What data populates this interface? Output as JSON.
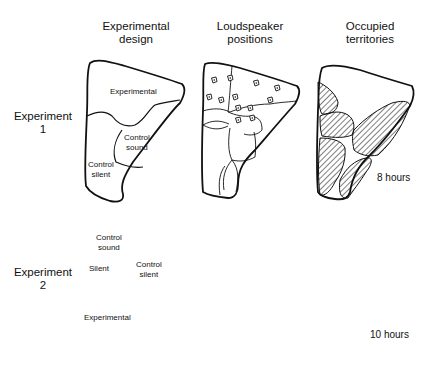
{
  "columns": [
    {
      "line1": "Experimental",
      "line2": "design"
    },
    {
      "line1": "Loudspeaker",
      "line2": "positions"
    },
    {
      "line1": "Occupied",
      "line2": "territories"
    }
  ],
  "rows": [
    {
      "line1": "Experiment",
      "line2": "1"
    },
    {
      "line1": "Experiment",
      "line2": "2"
    }
  ],
  "experiment1": {
    "design_regions": {
      "experimental": "Experimental",
      "control_sound_1": "Control",
      "control_sound_2": "sound",
      "control_silent_1": "Control",
      "control_silent_2": "silent"
    },
    "duration": "8 hours"
  },
  "experiment2": {
    "design_regions": {
      "control_sound_1": "Control",
      "control_sound_2": "sound",
      "silent": "Silent",
      "control_silent_1": "Control",
      "control_silent_2": "silent",
      "experimental": "Experimental"
    },
    "duration": "10 hours"
  },
  "icons": {
    "loudspeaker": "loudspeaker-icon",
    "hatching": "territory-hatch"
  }
}
